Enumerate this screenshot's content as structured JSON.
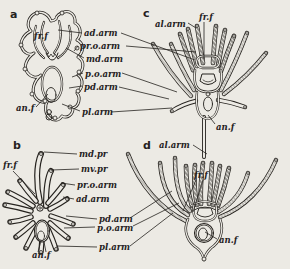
{
  "figure": {
    "paper_color": "#eceae4",
    "ink_color": "#25221e",
    "panels": [
      {
        "letter": "a",
        "labels": {
          "frf": "fr.f",
          "anf": "an.f"
        },
        "arm_labels": [
          "ad.arm",
          "pr.o.arm",
          "md.arm",
          "p.o.arm",
          "pd.arm",
          "pl.arm"
        ]
      },
      {
        "letter": "b",
        "labels": {
          "frf": "fr.f",
          "anf": "an.f"
        },
        "arm_labels": [
          "md.pr",
          "mv.pr",
          "pr.o.arm",
          "ad.arm",
          "pd.arm",
          "p.o.arm",
          "pl.arm"
        ]
      },
      {
        "letter": "c",
        "labels": {
          "alarm": "al.arm",
          "frf": "fr.f",
          "anf": "an.f"
        }
      },
      {
        "letter": "d",
        "labels": {
          "alarm": "al.arm",
          "frf": "fr.f",
          "anf": "an.f"
        }
      }
    ]
  }
}
